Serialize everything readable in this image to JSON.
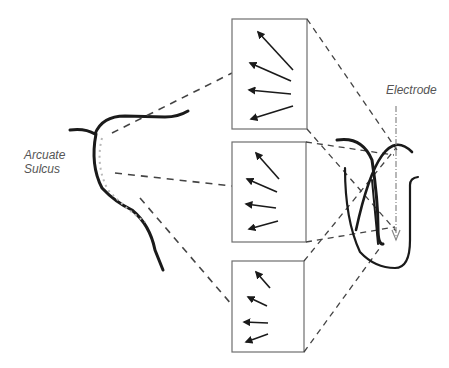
{
  "labels": {
    "arcuate_line1": "Arcuate",
    "arcuate_line2": "Sulcus",
    "electrode": "Electrode"
  },
  "colors": {
    "stroke": "#1a1a1a",
    "box": "#6e6e6e",
    "dashed": "#444444",
    "dotted": "#b8b8b8",
    "text": "#555555"
  },
  "panels": [
    {
      "id": "top",
      "arrows": 4
    },
    {
      "id": "middle",
      "arrows": 4
    },
    {
      "id": "bottom",
      "arrows": 4
    }
  ]
}
